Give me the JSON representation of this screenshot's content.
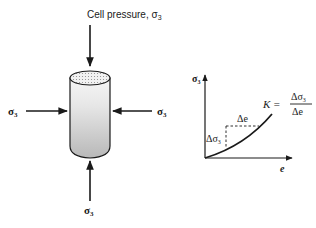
{
  "figure": {
    "cell": {
      "top_label": "Cell pressure, σ",
      "top_label_sub": "3",
      "left_label": "σ",
      "left_label_sub": "3",
      "right_label": "σ",
      "right_label_sub": "3",
      "bottom_label": "σ",
      "bottom_label_sub": "3"
    },
    "graph": {
      "y_axis_label": "σ",
      "y_axis_label_sub": "3",
      "x_axis_label": "e",
      "delta_e_label": "Δe",
      "delta_sigma_label": "Δσ",
      "delta_sigma_sub": "3",
      "equation_lhs": "K =",
      "equation_num": "Δσ",
      "equation_num_sub": "3",
      "equation_den": "Δe"
    },
    "colors": {
      "ink": "#1a1a1a",
      "specimen_fill_top": "#f4f4f4",
      "specimen_fill_bottom": "#bdbdbd"
    }
  }
}
